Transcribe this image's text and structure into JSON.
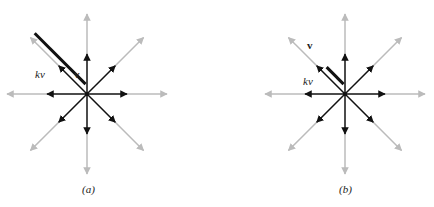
{
  "panels": [
    {
      "id": "a",
      "caption": "(a)",
      "v_label": "v",
      "kv_label": "kv",
      "k": 1.8
    },
    {
      "id": "b",
      "caption": "(b)",
      "v_label": "v",
      "kv_label": "kv",
      "k": 0.6
    }
  ],
  "colors": {
    "dark": "#111111",
    "light": "#bbbbbb"
  },
  "directions_deg": [
    0,
    45,
    90,
    135,
    180,
    225,
    270,
    315
  ]
}
